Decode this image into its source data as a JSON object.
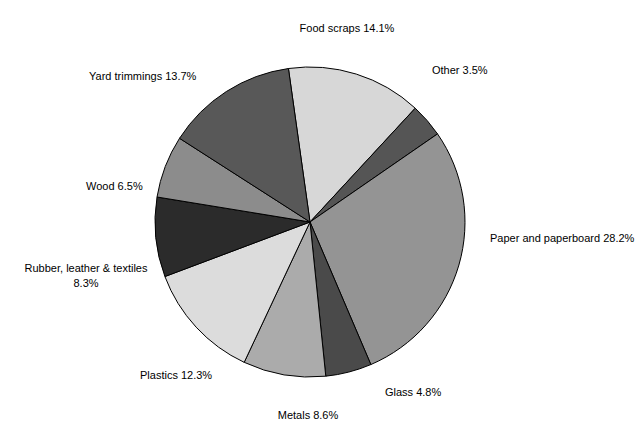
{
  "figure": {
    "background_color": "#ffffff",
    "width": 644,
    "height": 437
  },
  "chart_data": {
    "type": "pie",
    "title": "",
    "subtitle": "",
    "xlabel": "",
    "ylabel": "",
    "legend_position": "none",
    "labels_position": "outside",
    "units": "percent",
    "total": 100.0,
    "start_angle_deg": -8,
    "direction": "clockwise",
    "center": {
      "x": 310,
      "y": 222
    },
    "radius": 155,
    "categories": [
      "Food scraps",
      "Other",
      "Paper and paperboard",
      "Glass",
      "Metals",
      "Plastics",
      "Rubber, leather & textiles",
      "Wood",
      "Yard trimmings"
    ],
    "values": [
      14.1,
      3.5,
      28.2,
      4.8,
      8.6,
      12.3,
      8.3,
      6.5,
      13.7
    ],
    "colors": [
      "#d7d7d7",
      "#555555",
      "#949494",
      "#4a4a4a",
      "#ababab",
      "#dcdcdc",
      "#2b2b2b",
      "#8c8c8c",
      "#585858"
    ],
    "annotations": [
      "Food scraps 14.1%",
      "Other 3.5%",
      "Paper and paperboard 28.2%",
      "Glass 4.8%",
      "Metals 8.6%",
      "Plastics 12.3%",
      "Rubber, leather & textiles 8.3%",
      "Wood 6.5%",
      "Yard trimmings 13.7%"
    ]
  },
  "slices": [
    {
      "name": "food-scraps",
      "label": "Food scraps 14.1%",
      "label_line1": "Food scraps 14.1%",
      "label_line2": "",
      "value": 14.1,
      "color": "#d7d7d7",
      "label_x": 347,
      "label_y": 32,
      "anchor": "middle"
    },
    {
      "name": "other",
      "label": "Other 3.5%",
      "label_line1": "Other 3.5%",
      "label_line2": "",
      "value": 3.5,
      "color": "#555555",
      "label_x": 432,
      "label_y": 74,
      "anchor": "start"
    },
    {
      "name": "paper-and-paperboard",
      "label": "Paper and paperboard 28.2%",
      "label_line1": "Paper and paperboard 28.2%",
      "label_line2": "",
      "value": 28.2,
      "color": "#949494",
      "label_x": 490,
      "label_y": 242,
      "anchor": "start"
    },
    {
      "name": "glass",
      "label": "Glass 4.8%",
      "label_line1": "Glass 4.8%",
      "label_line2": "",
      "value": 4.8,
      "color": "#4a4a4a",
      "label_x": 385,
      "label_y": 396,
      "anchor": "start"
    },
    {
      "name": "metals",
      "label": "Metals 8.6%",
      "label_line1": "Metals 8.6%",
      "label_line2": "",
      "value": 8.6,
      "color": "#ababab",
      "label_x": 308,
      "label_y": 419,
      "anchor": "middle"
    },
    {
      "name": "plastics",
      "label": "Plastics 12.3%",
      "label_line1": "Plastics 12.3%",
      "label_line2": "",
      "value": 12.3,
      "color": "#dcdcdc",
      "label_x": 140,
      "label_y": 379,
      "anchor": "start"
    },
    {
      "name": "rubber-leather-textiles",
      "label": "Rubber, leather & textiles 8.3%",
      "label_line1": "Rubber, leather & textiles",
      "label_line2": "8.3%",
      "value": 8.3,
      "color": "#2b2b2b",
      "label_x": 86,
      "label_y": 272,
      "anchor": "middle"
    },
    {
      "name": "wood",
      "label": "Wood 6.5%",
      "label_line1": "Wood 6.5%",
      "label_line2": "",
      "value": 6.5,
      "color": "#8c8c8c",
      "label_x": 86,
      "label_y": 190,
      "anchor": "start"
    },
    {
      "name": "yard-trimmings",
      "label": "Yard trimmings 13.7%",
      "label_line1": "Yard trimmings 13.7%",
      "label_line2": "",
      "value": 13.7,
      "color": "#585858",
      "label_x": 89,
      "label_y": 80,
      "anchor": "start"
    }
  ]
}
